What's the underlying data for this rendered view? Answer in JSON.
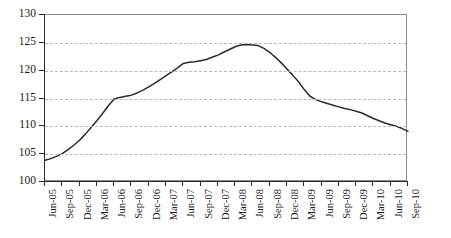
{
  "chart_data": {
    "type": "line",
    "title": "",
    "subtitle": "",
    "xlabel": "",
    "ylabel": "",
    "ylim": [
      100,
      130
    ],
    "ytick_step": 5,
    "yticks": [
      100,
      105,
      110,
      115,
      120,
      125,
      130
    ],
    "grid": true,
    "grid_style": "dashed-horizontal",
    "legend": "none",
    "line_color": "#2b2b2b",
    "grid_color": "#b9b9b9",
    "axis_color": "#2b2b2b",
    "frame_color": "#8a8a8a",
    "background_color": "#ffffff",
    "x_tick_labels": [
      "Jun-05",
      "Sep-05",
      "Dec-05",
      "Mar-06",
      "Jun-06",
      "Sep-06",
      "Dec-06",
      "Mar-07",
      "Jun-07",
      "Sep-07",
      "Dec-07",
      "Mar-08",
      "Jun-08",
      "Sep-08",
      "Dec-08",
      "Mar-09",
      "Jun-09",
      "Sep-09",
      "Dec-09",
      "Mar-10",
      "Jun-10",
      "Sep-10"
    ],
    "x_tick_interval": "quarterly",
    "x_range": [
      "Jun-05",
      "Sep-10"
    ],
    "series": [
      {
        "name": "index",
        "x": [
          "Jun-05",
          "Jul-05",
          "Aug-05",
          "Sep-05",
          "Oct-05",
          "Nov-05",
          "Dec-05",
          "Jan-06",
          "Feb-06",
          "Mar-06",
          "Apr-06",
          "May-06",
          "Jun-06",
          "Jul-06",
          "Aug-06",
          "Sep-06",
          "Oct-06",
          "Nov-06",
          "Dec-06",
          "Jan-07",
          "Feb-07",
          "Mar-07",
          "Apr-07",
          "May-07",
          "Jun-07",
          "Jul-07",
          "Aug-07",
          "Sep-07",
          "Oct-07",
          "Nov-07",
          "Dec-07",
          "Jan-08",
          "Feb-08",
          "Mar-08",
          "Apr-08",
          "May-08",
          "Jun-08",
          "Jul-08",
          "Aug-08",
          "Sep-08",
          "Oct-08",
          "Nov-08",
          "Dec-08",
          "Jan-09",
          "Feb-09",
          "Mar-09",
          "Apr-09",
          "May-09",
          "Jun-09",
          "Jul-09",
          "Aug-09",
          "Sep-09",
          "Oct-09",
          "Nov-09",
          "Dec-09",
          "Jan-10",
          "Feb-10",
          "Mar-10",
          "Apr-10",
          "May-10",
          "Jun-10",
          "Jul-10",
          "Aug-10",
          "Sep-10"
        ],
        "values": [
          103.9,
          104.2,
          104.6,
          105.1,
          105.8,
          106.6,
          107.5,
          108.6,
          109.8,
          111.0,
          112.3,
          113.7,
          114.9,
          115.2,
          115.4,
          115.6,
          116.0,
          116.5,
          117.1,
          117.7,
          118.4,
          119.1,
          119.8,
          120.5,
          121.3,
          121.5,
          121.6,
          121.8,
          122.0,
          122.4,
          122.8,
          123.3,
          123.8,
          124.3,
          124.6,
          124.7,
          124.6,
          124.5,
          124.0,
          123.3,
          122.4,
          121.4,
          120.3,
          119.2,
          118.0,
          116.6,
          115.4,
          114.8,
          114.4,
          114.1,
          113.8,
          113.5,
          113.2,
          113.0,
          112.7,
          112.4,
          111.9,
          111.4,
          111.0,
          110.6,
          110.3,
          110.0,
          109.6,
          109.1
        ],
        "start_value": 103.9,
        "peak_value": 124.7,
        "peak_at": "May-08",
        "end_value": 109.1,
        "min_value": 103.9
      }
    ]
  }
}
